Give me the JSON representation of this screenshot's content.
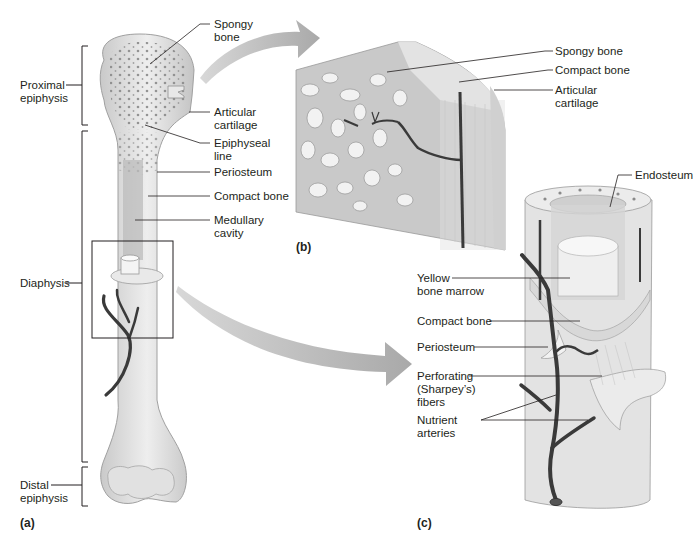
{
  "figure": {
    "panels": [
      {
        "id": "a",
        "label": "(a)"
      },
      {
        "id": "b",
        "label": "(b)"
      },
      {
        "id": "c",
        "label": "(c)"
      }
    ]
  },
  "panel_a": {
    "left_labels": [
      {
        "line1": "Proximal",
        "line2": "epiphysis"
      },
      {
        "line1": "Diaphysis",
        "line2": ""
      },
      {
        "line1": "Distal",
        "line2": "epiphysis"
      }
    ],
    "right_labels": [
      {
        "line1": "Spongy",
        "line2": "bone"
      },
      {
        "line1": "Articular",
        "line2": "cartilage"
      },
      {
        "line1": "Epiphyseal",
        "line2": "line"
      },
      {
        "line1": "Periosteum",
        "line2": ""
      },
      {
        "line1": "Compact bone",
        "line2": ""
      },
      {
        "line1": "Medullary",
        "line2": "cavity"
      }
    ]
  },
  "panel_b": {
    "labels": [
      {
        "line1": "Spongy bone",
        "line2": ""
      },
      {
        "line1": "Compact bone",
        "line2": ""
      },
      {
        "line1": "Articular",
        "line2": "cartilage"
      }
    ]
  },
  "panel_c": {
    "top_label": {
      "line1": "Endosteum"
    },
    "left_labels": [
      {
        "line1": "Yellow",
        "line2": "bone marrow",
        "line3": ""
      },
      {
        "line1": "Compact bone",
        "line2": "",
        "line3": ""
      },
      {
        "line1": "Periosteum",
        "line2": "",
        "line3": ""
      },
      {
        "line1": "Perforating",
        "line2": "(Sharpey’s)",
        "line3": "fibers"
      },
      {
        "line1": "Nutrient",
        "line2": "arteries",
        "line3": ""
      }
    ]
  },
  "colors": {
    "bone": "#d9d9d9",
    "bone_dark": "#a8a8a8",
    "vessel": "#3a3a3a",
    "arrow": "#b5b5b5",
    "line": "#231f20"
  }
}
